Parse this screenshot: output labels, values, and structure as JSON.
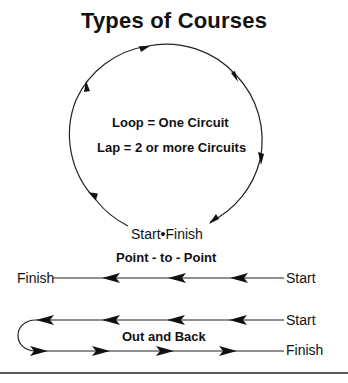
{
  "title": "Types of Courses",
  "loop": {
    "definition_loop": "Loop = One Circuit",
    "definition_lap": "Lap = 2 or more Circuits",
    "start_finish_label": "Start•Finish"
  },
  "point_to_point": {
    "heading": "Point - to - Point",
    "finish_label": "Finish",
    "start_label": "Start"
  },
  "out_and_back": {
    "heading": "Out and Back",
    "start_label": "Start",
    "finish_label": "Finish"
  },
  "colors": {
    "ink": "#111111",
    "background": "#ffffff"
  }
}
